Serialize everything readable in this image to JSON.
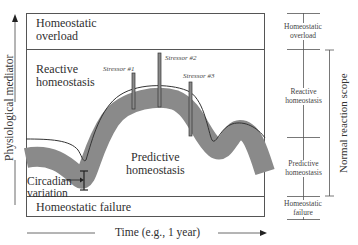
{
  "diagram": {
    "y_axis_label": "Physiological mediator",
    "x_axis_label": "Time (e.g., 1 year)",
    "zones": {
      "overload": [
        "Homeostatic",
        "overload"
      ],
      "reactive": [
        "Reactive",
        "homeostasis"
      ],
      "predictive": [
        "Predictive",
        "homeostasis"
      ],
      "failure": "Homeostatic failure"
    },
    "circadian": [
      "Circadian",
      "variation"
    ],
    "stressors": [
      "Stressor #1",
      "Stressor #2",
      "Stressor #3"
    ],
    "right_scale": {
      "overload": [
        "Homeostatic",
        "overload"
      ],
      "reactive": [
        "Reactive",
        "homeostasis"
      ],
      "predictive": [
        "Predictive",
        "homeostasis"
      ],
      "failure": [
        "Homeostatic",
        "failure"
      ]
    },
    "scope_label": "Normal reaction scope",
    "colors": {
      "band": "#8a8a8a",
      "lines": "#444444"
    }
  }
}
